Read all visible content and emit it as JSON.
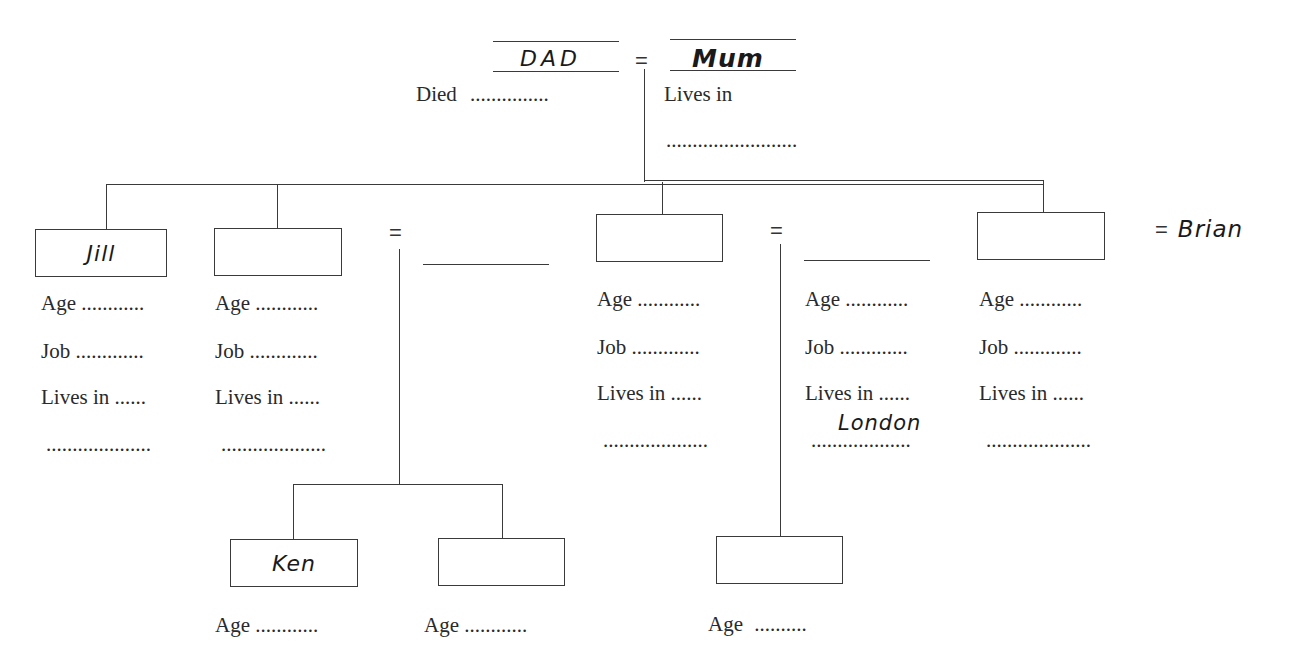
{
  "parents": {
    "father": {
      "name": "DAD",
      "field_label": "Died",
      "field_value": "..............."
    },
    "equals": "=",
    "mother": {
      "name": "Mum",
      "field_label": "Lives in",
      "field_value": "........................."
    }
  },
  "children": [
    {
      "name": "Jill",
      "age_label": "Age",
      "age_value": "............",
      "job_label": "Job",
      "job_value": ".............",
      "lives_label": "Lives in",
      "lives_value": "......",
      "lives_extra": "...................."
    },
    {
      "name": "",
      "age_label": "Age",
      "age_value": "............",
      "job_label": "Job",
      "job_value": ".............",
      "lives_label": "Lives in",
      "lives_value": "......",
      "lives_extra": "...................."
    },
    {
      "name": "",
      "age_label": "Age",
      "age_value": "............",
      "job_label": "Job",
      "job_value": ".............",
      "lives_label": "Lives in",
      "lives_value": "......",
      "lives_extra": "...................."
    },
    {
      "name": "",
      "age_label": "Age",
      "age_value": "............",
      "job_label": "Job",
      "job_value": ".............",
      "lives_label": "Lives in",
      "lives_value": "......",
      "lives_extra": "...................."
    }
  ],
  "spouses": [
    {
      "equals": "=",
      "name": ""
    },
    {
      "equals": "=",
      "name": "",
      "age_label": "Age",
      "age_value": "............",
      "job_label": "Job",
      "job_value": ".............",
      "lives_label": "Lives in",
      "lives_value": "......",
      "lives_extra": "...................",
      "lives_handwritten": "London"
    },
    {
      "equals": "=",
      "name": "Brian"
    }
  ],
  "grandchildren": [
    {
      "name": "Ken",
      "age_label": "Age",
      "age_value": "............"
    },
    {
      "name": "",
      "age_label": "Age",
      "age_value": "............"
    },
    {
      "name": "",
      "age_label": "Age",
      "age_value": ".........."
    }
  ]
}
